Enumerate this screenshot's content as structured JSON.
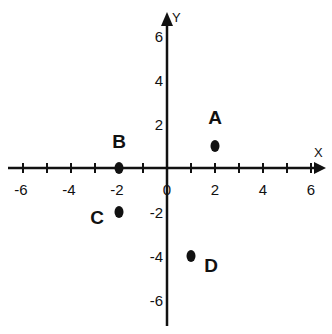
{
  "chart_data": {
    "type": "scatter",
    "title": "",
    "xlabel": "X",
    "ylabel": "Y",
    "xlim": [
      -6.5,
      6.5
    ],
    "ylim": [
      -6.5,
      6.5
    ],
    "grid": false,
    "x_ticks": [
      -6,
      -4,
      -2,
      0,
      2,
      4,
      6
    ],
    "x_tick_labels": [
      "-6",
      "-4",
      "-2",
      "0",
      "2",
      "4",
      "6"
    ],
    "y_ticks": [
      6,
      4,
      2,
      -2,
      -4,
      -6
    ],
    "y_tick_labels": [
      "6",
      "4",
      "2",
      "-2",
      "-4",
      "-6"
    ],
    "points": [
      {
        "label": "A",
        "x": 2,
        "y": 1
      },
      {
        "label": "B",
        "x": -2,
        "y": 0
      },
      {
        "label": "C",
        "x": -2,
        "y": -2
      },
      {
        "label": "D",
        "x": 1,
        "y": -4
      }
    ]
  },
  "colors": {
    "ink": "#111111",
    "background": "#ffffff"
  }
}
